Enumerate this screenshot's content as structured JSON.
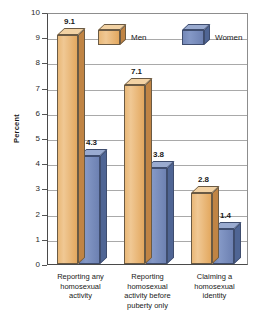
{
  "chart_data": {
    "type": "bar",
    "title": "",
    "subtitle": "",
    "xlabel": "",
    "ylabel": "Percent",
    "ylim": [
      0,
      10
    ],
    "ytick_labels": [
      "10",
      "9",
      "8",
      "7",
      "6",
      "5",
      "4",
      "3",
      "2",
      "1",
      "0"
    ],
    "ytick_values": [
      10,
      9,
      8,
      7,
      6,
      5,
      4,
      3,
      2,
      1,
      0
    ],
    "grid": true,
    "legend_position": "top-center",
    "categories": [
      "Reporting any homosexual activity",
      "Reporting homosexual activity before puberty only",
      "Claiming a homosexual identity"
    ],
    "category_lines": [
      [
        "Reporting any",
        "homosexual",
        "activity"
      ],
      [
        "Reporting",
        "homosexual",
        "activity before",
        "puberty only"
      ],
      [
        "Claiming a",
        "homosexual",
        "identity"
      ]
    ],
    "series": [
      {
        "name": "Men",
        "color": "#e9b878",
        "values": [
          9.1,
          7.1,
          2.8
        ],
        "labels": [
          "9.1",
          "7.1",
          "2.8"
        ]
      },
      {
        "name": "Women",
        "color": "#7488b8",
        "values": [
          4.3,
          3.8,
          1.4
        ],
        "labels": [
          "4.3",
          "3.8",
          "1.4"
        ]
      }
    ]
  },
  "legend": {
    "entries": [
      {
        "label": "Men",
        "swatch": "cube-orange-icon"
      },
      {
        "label": "Women",
        "swatch": "cube-blue-icon"
      }
    ]
  },
  "colors": {
    "men_front": "#e9b878",
    "men_top": "#f2d2a4",
    "men_side": "#c08444",
    "women_front": "#7488b8",
    "women_top": "#9aabd0",
    "women_side": "#4f6594",
    "gridline": "#a9a9a9",
    "axis": "#4a4a4a",
    "text": "#1a1a1a",
    "background": "#ffffff"
  }
}
